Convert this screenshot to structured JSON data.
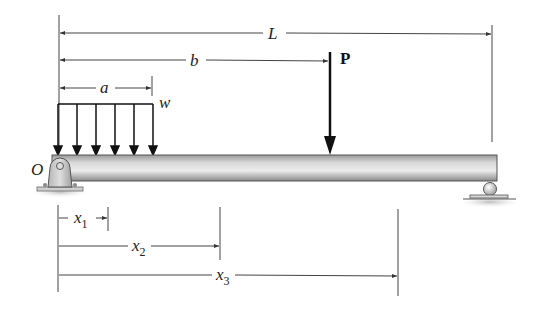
{
  "diagram": {
    "type": "simply-supported-beam",
    "labels": {
      "L": "L",
      "b": "b",
      "a": "a",
      "w": "w",
      "P": "P",
      "O": "O",
      "x1_base": "x",
      "x1_sub": "1",
      "x2_base": "x",
      "x2_sub": "2",
      "x3_base": "x",
      "x3_sub": "3"
    },
    "loads": [
      {
        "name": "distributed load",
        "symbol": "w",
        "extent": "a"
      },
      {
        "name": "point load",
        "symbol": "P",
        "position": "b"
      }
    ],
    "supports": [
      {
        "name": "pin support",
        "location": "O (left end)"
      },
      {
        "name": "roller support",
        "location": "right end"
      }
    ],
    "dimensions": [
      "L",
      "b",
      "a",
      "x1",
      "x2",
      "x3"
    ],
    "colors": {
      "line": "#333333",
      "beam_light": "#e6e6e6",
      "beam_dark": "#8a8a8a",
      "arrow": "#111111"
    }
  }
}
